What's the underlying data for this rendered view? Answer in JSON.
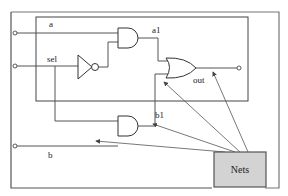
{
  "diagram": {
    "type": "logic-circuit-mux",
    "labels": {
      "input_a": "a",
      "input_sel": "sel",
      "input_b": "b",
      "net_a1": "a1",
      "net_b1": "b1",
      "output": "out"
    },
    "callout": {
      "text": "Nets",
      "fill": "#d3d3d3"
    },
    "gates": [
      "NOT",
      "AND",
      "AND",
      "OR"
    ],
    "colors": {
      "line": "#555555",
      "frame": "#666666",
      "callout_fill": "#d3d3d3"
    }
  }
}
